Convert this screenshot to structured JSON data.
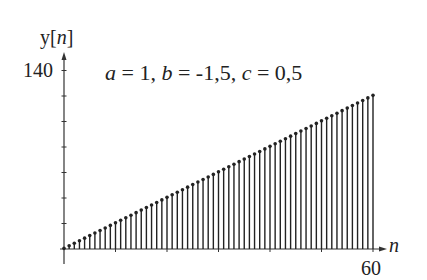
{
  "chart_data": {
    "type": "stem",
    "title": "",
    "annotation": "a = 1, b = -1,5, c = 0,5",
    "parameters": {
      "a": "1",
      "b": "-1,5",
      "c": "0,5"
    },
    "xlabel": "n",
    "ylabel": "y[n]",
    "xlim": [
      0,
      60
    ],
    "ylim": [
      0,
      140
    ],
    "x_tick_labels": [
      "60"
    ],
    "y_tick_labels": [
      "140"
    ],
    "y_minor_ticks": [
      20,
      40,
      60,
      80,
      100,
      120,
      140
    ],
    "x": [
      0,
      1,
      2,
      3,
      4,
      5,
      6,
      7,
      8,
      9,
      10,
      11,
      12,
      13,
      14,
      15,
      16,
      17,
      18,
      19,
      20,
      21,
      22,
      23,
      24,
      25,
      26,
      27,
      28,
      29,
      30,
      31,
      32,
      33,
      34,
      35,
      36,
      37,
      38,
      39,
      40,
      41,
      42,
      43,
      44,
      45,
      46,
      47,
      48,
      49,
      50,
      51,
      52,
      53,
      54,
      55,
      56,
      57,
      58,
      59,
      60
    ],
    "values": [
      0.5,
      2.5,
      4.5,
      6.5,
      8.5,
      10.5,
      12.5,
      14.5,
      16.5,
      18.5,
      20.5,
      22.5,
      24.5,
      26.5,
      28.5,
      30.5,
      32.5,
      34.5,
      36.5,
      38.5,
      40.5,
      42.5,
      44.5,
      46.5,
      48.5,
      50.5,
      52.5,
      54.5,
      56.5,
      58.5,
      60.5,
      62.5,
      64.5,
      66.5,
      68.5,
      70.5,
      72.5,
      74.5,
      76.5,
      78.5,
      80.5,
      82.5,
      84.5,
      86.5,
      88.5,
      90.5,
      92.5,
      94.5,
      96.5,
      98.5,
      100.5,
      102.5,
      104.5,
      106.5,
      108.5,
      110.5,
      112.5,
      114.5,
      116.5,
      118.5,
      120.5
    ],
    "grid": false,
    "legend": null
  },
  "labels": {
    "ylabel_prefix": "y[",
    "ylabel_var": "n",
    "ylabel_suffix": "]",
    "ytick_top": "140",
    "xtick_end": "60",
    "xlabel": "n",
    "annot": {
      "a_var": "a",
      "a_eq": " = 1, ",
      "b_var": "b",
      "b_eq": " = -1,5, ",
      "c_var": "c",
      "c_eq": " = 0,5"
    }
  },
  "colors": {
    "stem": "#222222",
    "axis": "#333333"
  }
}
